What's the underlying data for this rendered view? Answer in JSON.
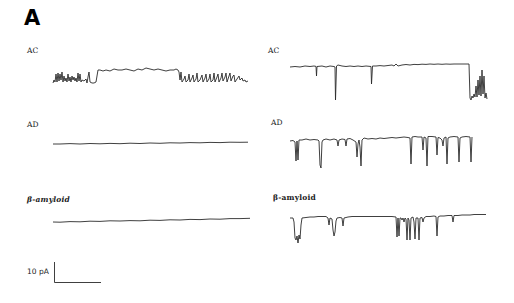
{
  "figure": {
    "panel_letter": "A",
    "left_column": {
      "traces": [
        {
          "label": "AC"
        },
        {
          "label": "AD"
        },
        {
          "label": "β-amyloid"
        }
      ]
    },
    "right_column": {
      "traces": [
        {
          "label": "AC"
        },
        {
          "label": "AD"
        },
        {
          "label": "β-amyloid"
        }
      ]
    },
    "scale_bar": {
      "label": "10 pA"
    }
  }
}
